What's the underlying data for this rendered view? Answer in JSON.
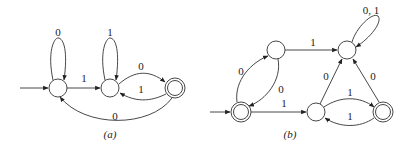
{
  "diagrams": [
    {
      "id": "a",
      "caption": "(a)",
      "states": [
        {
          "id": "q0",
          "accepting": false,
          "initial": true
        },
        {
          "id": "q1",
          "accepting": false,
          "initial": false
        },
        {
          "id": "q2",
          "accepting": true,
          "initial": false
        }
      ],
      "transitions": [
        {
          "from": "q0",
          "to": "q0",
          "label": "0"
        },
        {
          "from": "q0",
          "to": "q1",
          "label": "1"
        },
        {
          "from": "q1",
          "to": "q1",
          "label": "1"
        },
        {
          "from": "q1",
          "to": "q2",
          "label": "0"
        },
        {
          "from": "q2",
          "to": "q1",
          "label": "1"
        },
        {
          "from": "q2",
          "to": "q0",
          "label": "0"
        }
      ]
    },
    {
      "id": "b",
      "caption": "(b)",
      "states": [
        {
          "id": "p0",
          "accepting": true,
          "initial": true
        },
        {
          "id": "p1",
          "accepting": false,
          "initial": false
        },
        {
          "id": "p2",
          "accepting": false,
          "initial": false
        },
        {
          "id": "p3",
          "accepting": false,
          "initial": false
        },
        {
          "id": "p4",
          "accepting": true,
          "initial": false
        }
      ],
      "transitions": [
        {
          "from": "p0",
          "to": "p1",
          "label": "0"
        },
        {
          "from": "p1",
          "to": "p0",
          "label": "0"
        },
        {
          "from": "p1",
          "to": "p2",
          "label": "1"
        },
        {
          "from": "p2",
          "to": "p2",
          "label": "0, 1"
        },
        {
          "from": "p0",
          "to": "p3",
          "label": "1"
        },
        {
          "from": "p3",
          "to": "p2",
          "label": "0"
        },
        {
          "from": "p3",
          "to": "p4",
          "label": "1"
        },
        {
          "from": "p4",
          "to": "p3",
          "label": "1"
        },
        {
          "from": "p4",
          "to": "p2",
          "label": "0"
        }
      ]
    }
  ]
}
